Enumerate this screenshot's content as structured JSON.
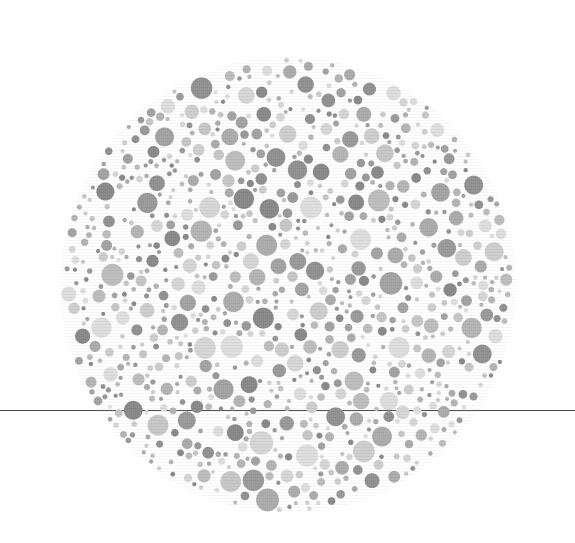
{
  "canvas": {
    "width": 575,
    "height": 543,
    "background_color": "#ffffff"
  },
  "figure": {
    "kind": "ishihara-plate",
    "center_x": 288,
    "center_y": 285,
    "radius": 228
  },
  "rule": {
    "name": "horizontal-rule",
    "y": 410,
    "thickness": 1,
    "color": "#4a4a4a",
    "x_start": 0,
    "x_end": 575
  },
  "dots": {
    "count_approx": 900,
    "min_diameter": 4,
    "max_diameter": 24,
    "texture": "vertical-print-striping",
    "palette": [
      "#dedede",
      "#d6d6d6",
      "#cecece",
      "#c6c6c6",
      "#bdbdbd",
      "#b4b4b4",
      "#ababab",
      "#a2a2a2",
      "#999999",
      "#909090",
      "#888888"
    ],
    "gap_color": "#ffffff",
    "seed": 20240517
  },
  "chart_data": {
    "type": "scatter",
    "title": "",
    "xlabel": "",
    "ylabel": "",
    "series": [
      {
        "name": "plate-dots",
        "marker": "circle",
        "note": "Dots are procedurally packed inside the plate disc; sizes and gray levels are randomized within the stated ranges."
      }
    ],
    "xlim": [
      0,
      575
    ],
    "ylim": [
      0,
      543
    ],
    "grid": false,
    "legend": false
  }
}
